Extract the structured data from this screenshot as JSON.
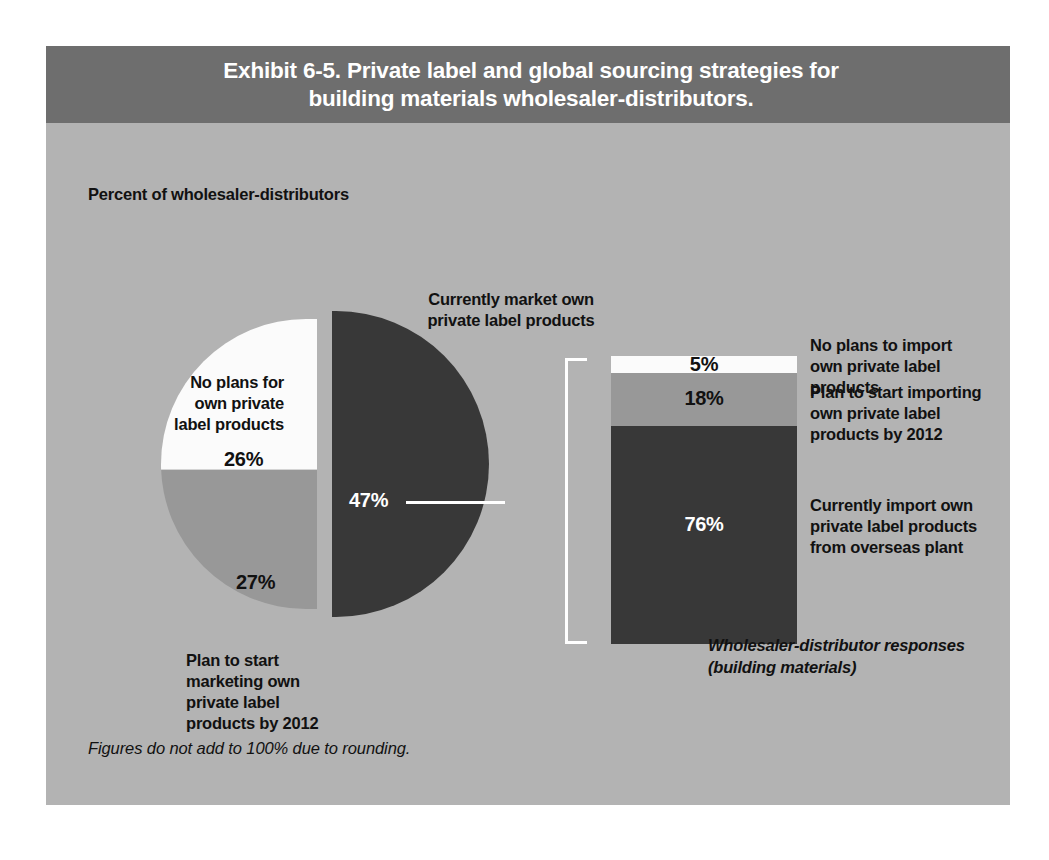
{
  "exhibit": {
    "title_line1": "Exhibit 6-5. Private label and global sourcing strategies for",
    "title_line2": "building materials wholesaler-distributors.",
    "subtitle": "Percent of wholesaler-distributors",
    "caption_line1": "Wholesaler-distributor responses",
    "caption_line2": "(building materials)",
    "footnote": "Figures do not add to 100% due to rounding."
  },
  "pie": {
    "label_top": "Currently market own private label products",
    "label_top_l1": "Currently market own",
    "label_top_l2": "private label products",
    "label_left_l1": "No plans for",
    "label_left_l2": "own private",
    "label_left_l3": "label products",
    "label_bottom_l1": "Plan to start",
    "label_bottom_l2": "marketing own",
    "label_bottom_l3": "private label",
    "label_bottom_l4": "products by 2012",
    "pct_dark": "47%",
    "pct_gray": "27%",
    "pct_white": "26%"
  },
  "bar": {
    "pct_white": "5%",
    "pct_gray": "18%",
    "pct_dark": "76%",
    "label_white_l1": "No plans to import",
    "label_white_l2": "own private label products",
    "label_gray_l1": "Plan to start importing",
    "label_gray_l2": "own private label",
    "label_gray_l3": "products by 2012",
    "label_dark_l1": "Currently import own",
    "label_dark_l2": "private label products",
    "label_dark_l3": "from overseas plant"
  },
  "colors": {
    "header_bg": "#6e6e6e",
    "body_bg": "#b3b3b3",
    "dark_slice": "#383838",
    "gray_slice": "#989898",
    "white_slice": "#fbfbfb",
    "text": "#111111",
    "inverse_text": "#ffffff"
  },
  "chart_data": [
    {
      "type": "pie",
      "title": "Exhibit 6-5. Private label and global sourcing strategies for building materials wholesaler-distributors.",
      "subtitle": "Percent of wholesaler-distributors",
      "categories": [
        "Currently market own private label products",
        "Plan to start marketing own private label products by 2012",
        "No plans for own private label products"
      ],
      "values": [
        47,
        27,
        26
      ],
      "value_labels": [
        "47%",
        "27%",
        "26%"
      ],
      "colors": [
        "#383838",
        "#989898",
        "#fbfbfb"
      ],
      "exploded_slice": "Currently market own private label products",
      "legend": "none (direct labels)",
      "note": "Figures do not add to 100% due to rounding."
    },
    {
      "type": "bar",
      "orientation": "stacked-vertical",
      "title": "Detail of the 47% who currently market own private label products",
      "subtitle": "Wholesaler-distributor responses (building materials)",
      "categories": [
        "No plans to import own private label products",
        "Plan to start importing own private label products by 2012",
        "Currently import own private label products from overseas plant"
      ],
      "values": [
        5,
        18,
        76
      ],
      "value_labels": [
        "5%",
        "18%",
        "76%"
      ],
      "colors": [
        "#fbfbfb",
        "#989898",
        "#383838"
      ],
      "stack_order_top_to_bottom": [
        "5%",
        "18%",
        "76%"
      ],
      "ylim": [
        0,
        99
      ],
      "ylabel": "",
      "xlabel": "",
      "grid": false,
      "note": "Figures do not add to 100% due to rounding."
    }
  ]
}
